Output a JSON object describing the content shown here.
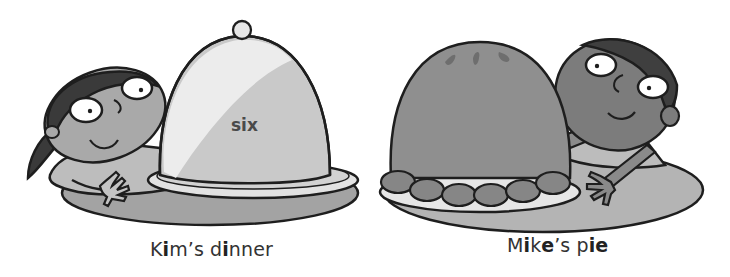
{
  "scenes": [
    {
      "id": "kim",
      "caption_parts": [
        {
          "text": "K",
          "bold": false
        },
        {
          "text": "i",
          "bold": true
        },
        {
          "text": "m’s d",
          "bold": false
        },
        {
          "text": "i",
          "bold": true
        },
        {
          "text": "nner",
          "bold": false
        }
      ],
      "caption_full": "Kim’s dinner",
      "cloche_label": "six",
      "character": "girl",
      "object": "covered dish (cloche)"
    },
    {
      "id": "mike",
      "caption_parts": [
        {
          "text": "M",
          "bold": false
        },
        {
          "text": "i",
          "bold": true
        },
        {
          "text": "k",
          "bold": false
        },
        {
          "text": "e",
          "bold": true
        },
        {
          "text": "’s p",
          "bold": false
        },
        {
          "text": "ie",
          "bold": true
        }
      ],
      "caption_full": "Mike’s pie",
      "character": "boy",
      "object": "pie"
    }
  ],
  "colors": {
    "outline": "#1e1e1e",
    "skin_girl": "#a9a9a9",
    "skin_boy": "#7c7c7c",
    "hair": "#3a3a3a",
    "plate": "#a3a3a3",
    "cloche_light": "#eeeeee",
    "cloche_shade": "#c9c9c9",
    "pie": "#8f8f8f",
    "text": "#333333"
  }
}
